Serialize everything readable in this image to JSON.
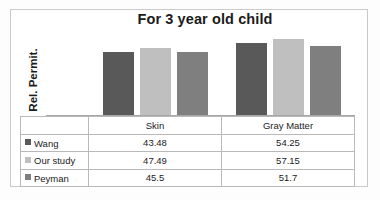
{
  "chart_data": {
    "type": "bar",
    "title": "For 3 year old child",
    "xlabel": "",
    "ylabel": "Rel. Permit.",
    "categories": [
      "Skin",
      "Gray Matter"
    ],
    "series": [
      {
        "name": "Wang",
        "values": [
          43.48,
          54.25
        ],
        "color": "#595959"
      },
      {
        "name": "Our study",
        "values": [
          47.49,
          57.15
        ],
        "color": "#bfbfbf"
      },
      {
        "name": "Peyman",
        "values": [
          45.5,
          51.7
        ],
        "color": "#7f7f7f"
      }
    ],
    "ylim": [
      0,
      62
    ],
    "grid": false,
    "legend_position": "table-left",
    "has_data_table": true
  },
  "table": {
    "column_headers": [
      "Skin",
      "Gray Matter"
    ],
    "rows": [
      {
        "label": "Wang",
        "swatch": "dark-gray-swatch",
        "values": [
          "43.48",
          "54.25"
        ]
      },
      {
        "label": "Our study",
        "swatch": "light-gray-swatch",
        "values": [
          "47.49",
          "57.15"
        ]
      },
      {
        "label": "Peyman",
        "swatch": "medium-gray-swatch",
        "values": [
          "45.5",
          "51.7"
        ]
      }
    ]
  },
  "bars": {
    "skin": [
      {
        "series": "Wang",
        "value": "43.48",
        "height_px": 64
      },
      {
        "series": "Our study",
        "value": "47.49",
        "height_px": 68
      },
      {
        "series": "Peyman",
        "value": "45.5",
        "height_px": 64
      }
    ],
    "gray_matter": [
      {
        "series": "Wang",
        "value": "54.25",
        "height_px": 73
      },
      {
        "series": "Our study",
        "value": "57.15",
        "height_px": 77
      },
      {
        "series": "Peyman",
        "value": "51.7",
        "height_px": 70
      }
    ]
  },
  "colors": {
    "wang": "#595959",
    "our_study": "#bfbfbf",
    "peyman": "#7f7f7f",
    "frame": "#c9c9c9",
    "grid_line": "#b9b9b9"
  }
}
